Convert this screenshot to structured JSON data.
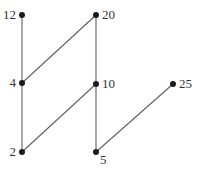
{
  "diagram": {
    "type": "graph",
    "background_color": "#ffffff",
    "edge_color": "#606060",
    "edge_width": 1.1,
    "node_color": "#1c1c1c",
    "node_radius": 3,
    "label_color": "#333333",
    "nodes": [
      {
        "id": "12",
        "label": "12",
        "x": 22,
        "y": 15,
        "label_side": "left"
      },
      {
        "id": "20",
        "label": "20",
        "x": 96,
        "y": 15,
        "label_side": "right"
      },
      {
        "id": "4",
        "label": "4",
        "x": 22,
        "y": 83,
        "label_side": "left"
      },
      {
        "id": "10",
        "label": "10",
        "x": 96,
        "y": 84,
        "label_side": "right"
      },
      {
        "id": "25",
        "label": "25",
        "x": 173,
        "y": 84,
        "label_side": "right"
      },
      {
        "id": "2",
        "label": "2",
        "x": 22,
        "y": 152,
        "label_side": "left"
      },
      {
        "id": "5",
        "label": "5",
        "x": 96,
        "y": 152,
        "label_side": "below-right"
      }
    ],
    "edges": [
      {
        "from": "12",
        "to": "4"
      },
      {
        "from": "4",
        "to": "2"
      },
      {
        "from": "4",
        "to": "20"
      },
      {
        "from": "2",
        "to": "10"
      },
      {
        "from": "20",
        "to": "10"
      },
      {
        "from": "10",
        "to": "5"
      },
      {
        "from": "5",
        "to": "25"
      }
    ]
  }
}
